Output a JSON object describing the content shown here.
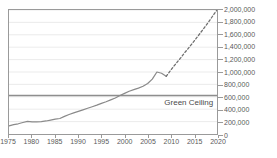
{
  "chart_data": {
    "type": "line",
    "title": "Nuclear Arrivals in Industries",
    "xlabel": "",
    "ylabel": "",
    "xlim": [
      1975,
      2020
    ],
    "ylim": [
      0,
      2000000
    ],
    "grid": true,
    "legend_position": "none",
    "x_ticks": [
      1975,
      1980,
      1985,
      1990,
      1995,
      2000,
      2005,
      2010,
      2015,
      2020
    ],
    "x_tick_labels": [
      "1975",
      "1980",
      "1985",
      "1990",
      "1995",
      "2000",
      "2005",
      "2010",
      "2015",
      "2020"
    ],
    "y_ticks": [
      0,
      200000,
      400000,
      600000,
      800000,
      1000000,
      1200000,
      1400000,
      1600000,
      1800000,
      2000000
    ],
    "y_tick_labels": [
      "0",
      "200,000",
      "400,000",
      "600,000",
      "800,000",
      "1,000,000",
      "1,200,000",
      "1,400,000",
      "1,600,000",
      "1,800,000",
      "2,000,000"
    ],
    "y_axis_side": "right",
    "series": [
      {
        "name": "Historical",
        "style": "solid",
        "color": "#8a8a8a",
        "x": [
          1975,
          1976,
          1977,
          1978,
          1979,
          1980,
          1981,
          1982,
          1983,
          1984,
          1985,
          1986,
          1987,
          1988,
          1989,
          1990,
          1991,
          1992,
          1993,
          1994,
          1995,
          1996,
          1997,
          1998,
          1999,
          2000,
          2001,
          2002,
          2003,
          2004,
          2005,
          2006,
          2007,
          2008,
          2009
        ],
        "values": [
          130000,
          150000,
          165000,
          185000,
          205000,
          195000,
          195000,
          200000,
          210000,
          225000,
          240000,
          250000,
          285000,
          315000,
          340000,
          365000,
          390000,
          415000,
          440000,
          465000,
          495000,
          520000,
          550000,
          580000,
          620000,
          655000,
          690000,
          715000,
          740000,
          770000,
          815000,
          885000,
          1000000,
          980000,
          930000
        ]
      },
      {
        "name": "Projection",
        "style": "dotted",
        "color": "#6f6f6f",
        "x": [
          2009,
          2010,
          2011,
          2012,
          2013,
          2014,
          2015,
          2016,
          2017,
          2018,
          2019,
          2020
        ],
        "values": [
          930000,
          1030000,
          1125000,
          1215000,
          1310000,
          1400000,
          1495000,
          1590000,
          1690000,
          1790000,
          1895000,
          2000000
        ]
      }
    ],
    "reference_lines": [
      {
        "name": "Green Ceiling",
        "label": "Green Ceiling",
        "value": 620000,
        "orientation": "horizontal",
        "color": "#8e8e8e"
      }
    ]
  }
}
